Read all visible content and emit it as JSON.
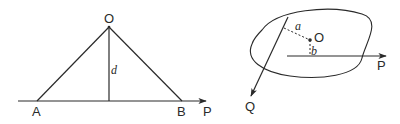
{
  "figure_left": {
    "title": "Triangle with force P along base",
    "points": {
      "O": {
        "label": "O",
        "x": 109,
        "y": 27
      },
      "A": {
        "label": "A",
        "x": 37,
        "y": 101
      },
      "B": {
        "label": "B",
        "x": 182,
        "y": 101
      }
    },
    "force": {
      "label": "P"
    },
    "distance": {
      "label": "d"
    }
  },
  "figure_right": {
    "title": "Rigid body with forces P and Q and point O",
    "point": {
      "label": "O"
    },
    "forces": [
      {
        "label": "P"
      },
      {
        "label": "Q"
      }
    ],
    "distances": [
      {
        "label": "a"
      },
      {
        "label": "b"
      }
    ]
  },
  "colors": {
    "line": "#2a2a2a",
    "background": "#ffffff"
  }
}
